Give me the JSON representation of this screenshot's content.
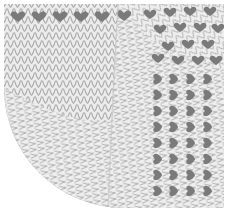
{
  "image": {
    "subject": "knitted swatch",
    "description": "Gray knitted fabric swatch with vertical stockinette stitches on the left/top, a curved quarter-circle boundary at the bottom-left, and a diagonal field of dark heart/V-shaped motifs in the upper-right corner region",
    "caption": "Knitted swatch with heart motif corner"
  },
  "colors": {
    "background": "#ffffff",
    "stitch_light": "#d6d6d6",
    "stitch_mid": "#b4b4b4",
    "stitch_dark": "#9a9a9a",
    "motif": "#7a7a7a"
  },
  "layout": {
    "width": 229,
    "height": 212,
    "curve_radius": 120,
    "diagonal_from": [
      118,
      0
    ],
    "diagonal_to": [
      108,
      212
    ]
  }
}
